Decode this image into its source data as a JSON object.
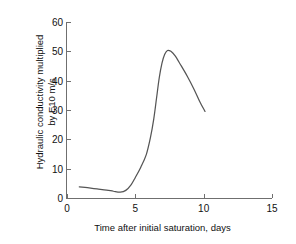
{
  "chart_data": {
    "type": "line",
    "title": "",
    "xlabel": "Time after initial saturation, days",
    "ylabel_line1": "Hydraulic conductivity multiplied",
    "ylabel_line2": "by E10 m/s",
    "xlim": [
      0,
      15
    ],
    "ylim": [
      0,
      60
    ],
    "xticks": [
      0,
      5,
      10,
      15
    ],
    "yticks": [
      0,
      10,
      20,
      30,
      40,
      50,
      60
    ],
    "xtick_labels": [
      "0",
      "5",
      "10",
      "15"
    ],
    "ytick_labels": [
      "0",
      "10",
      "20",
      "30",
      "40",
      "50",
      "60"
    ],
    "grid": false,
    "legend": false,
    "series": [
      {
        "name": "Hydraulic conductivity",
        "color": "#555555",
        "x": [
          0.9,
          1.5,
          2.2,
          2.9,
          3.4,
          3.9,
          4.3,
          4.7,
          5.0,
          5.4,
          5.8,
          6.1,
          6.35,
          6.55,
          6.75,
          6.95,
          7.15,
          7.35,
          7.6,
          7.9,
          8.3,
          8.8,
          9.3,
          9.7,
          10.1
        ],
        "y": [
          3.8,
          3.5,
          3.1,
          2.7,
          2.3,
          2.0,
          2.6,
          4.6,
          7.0,
          10.5,
          14.8,
          20.5,
          27.0,
          34.0,
          41.0,
          46.0,
          49.0,
          50.3,
          50.0,
          48.5,
          45.5,
          41.5,
          37.0,
          33.0,
          29.5
        ]
      }
    ]
  },
  "axes": {
    "y_title_line1": "Hydraulic conductivity multiplied",
    "y_title_line2": "by E10 m/s",
    "x_title": "Time after initial saturation, days"
  }
}
